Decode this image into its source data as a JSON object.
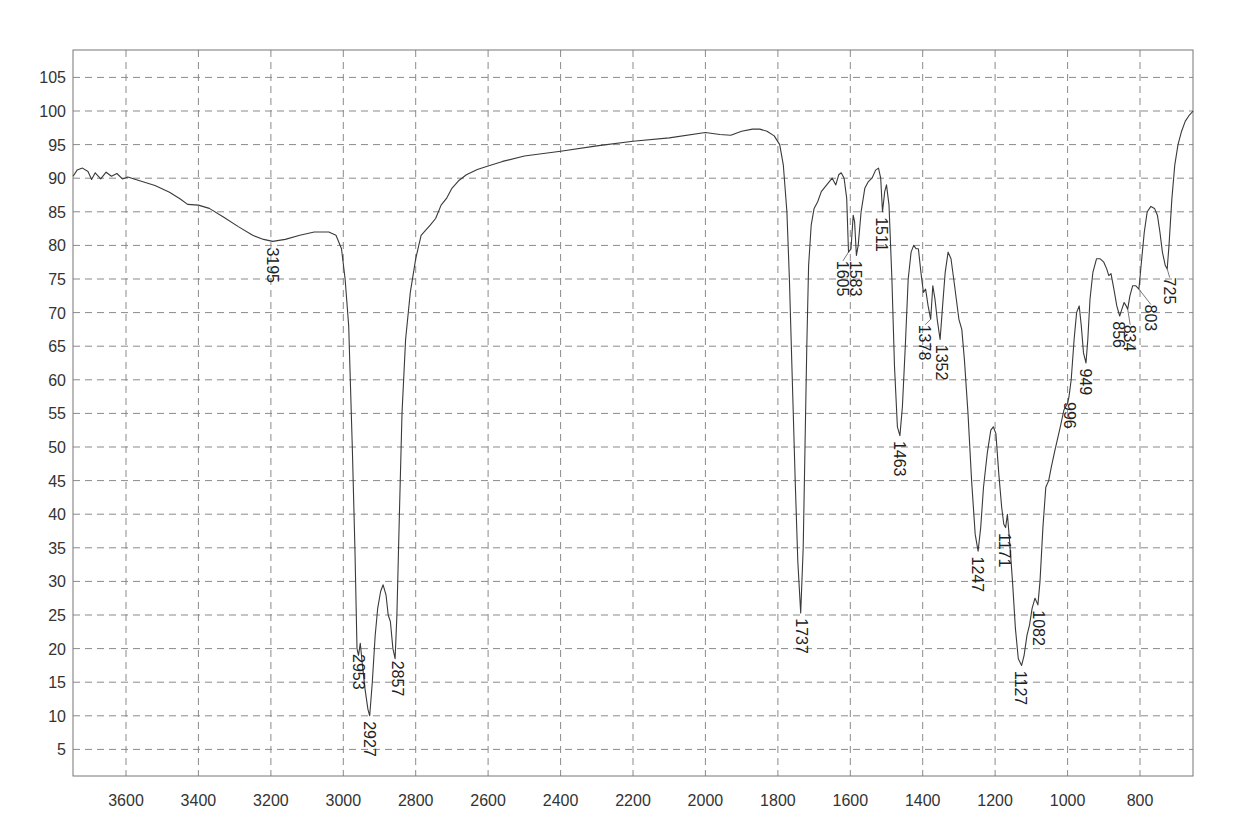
{
  "chart_data": {
    "type": "line",
    "title": "",
    "xlabel": "",
    "ylabel": "",
    "xlim": [
      3746,
      653
    ],
    "ylim": [
      1,
      109
    ],
    "x_reversed": true,
    "grid": true,
    "legend": null,
    "x_ticks": [
      3600,
      3400,
      3200,
      3000,
      2800,
      2600,
      2400,
      2200,
      2000,
      1800,
      1600,
      1400,
      1200,
      1000,
      800
    ],
    "y_ticks": [
      5,
      10,
      15,
      20,
      25,
      30,
      35,
      40,
      45,
      50,
      55,
      60,
      65,
      70,
      75,
      80,
      85,
      90,
      95,
      100,
      105
    ],
    "series": [
      {
        "name": "IR spectrum (%T)",
        "points": [
          [
            3746,
            90.3
          ],
          [
            3735,
            91.2
          ],
          [
            3720,
            91.5
          ],
          [
            3705,
            91.0
          ],
          [
            3695,
            89.8
          ],
          [
            3685,
            90.8
          ],
          [
            3670,
            89.9
          ],
          [
            3655,
            90.9
          ],
          [
            3640,
            90.3
          ],
          [
            3625,
            90.7
          ],
          [
            3610,
            89.9
          ],
          [
            3595,
            90.2
          ],
          [
            3560,
            89.6
          ],
          [
            3520,
            88.9
          ],
          [
            3480,
            87.9
          ],
          [
            3450,
            86.9
          ],
          [
            3430,
            86.1
          ],
          [
            3400,
            86.0
          ],
          [
            3370,
            85.5
          ],
          [
            3330,
            84.2
          ],
          [
            3290,
            82.8
          ],
          [
            3250,
            81.5
          ],
          [
            3220,
            80.9
          ],
          [
            3195,
            80.6
          ],
          [
            3160,
            80.9
          ],
          [
            3120,
            81.5
          ],
          [
            3080,
            82.0
          ],
          [
            3040,
            82.0
          ],
          [
            3020,
            81.5
          ],
          [
            3005,
            79.5
          ],
          [
            2995,
            75.0
          ],
          [
            2985,
            68.0
          ],
          [
            2975,
            50.0
          ],
          [
            2968,
            35.0
          ],
          [
            2962,
            20.0
          ],
          [
            2958,
            19.0
          ],
          [
            2953,
            20.8
          ],
          [
            2948,
            18.0
          ],
          [
            2940,
            14.0
          ],
          [
            2932,
            11.0
          ],
          [
            2927,
            10.0
          ],
          [
            2920,
            15.0
          ],
          [
            2912,
            22.0
          ],
          [
            2905,
            26.0
          ],
          [
            2897,
            28.5
          ],
          [
            2890,
            29.5
          ],
          [
            2882,
            28.0
          ],
          [
            2876,
            25.0
          ],
          [
            2870,
            24.0
          ],
          [
            2863,
            20.0
          ],
          [
            2857,
            18.5
          ],
          [
            2852,
            25.0
          ],
          [
            2845,
            40.0
          ],
          [
            2838,
            55.0
          ],
          [
            2828,
            66.0
          ],
          [
            2815,
            73.0
          ],
          [
            2800,
            78.0
          ],
          [
            2785,
            81.5
          ],
          [
            2760,
            83.0
          ],
          [
            2745,
            84.0
          ],
          [
            2730,
            86.0
          ],
          [
            2715,
            87.0
          ],
          [
            2700,
            88.5
          ],
          [
            2680,
            89.7
          ],
          [
            2660,
            90.5
          ],
          [
            2630,
            91.3
          ],
          [
            2600,
            91.8
          ],
          [
            2560,
            92.5
          ],
          [
            2500,
            93.3
          ],
          [
            2400,
            94.0
          ],
          [
            2300,
            94.8
          ],
          [
            2200,
            95.5
          ],
          [
            2100,
            96.0
          ],
          [
            2000,
            96.8
          ],
          [
            1960,
            96.5
          ],
          [
            1930,
            96.4
          ],
          [
            1900,
            97.0
          ],
          [
            1870,
            97.3
          ],
          [
            1850,
            97.3
          ],
          [
            1830,
            97.0
          ],
          [
            1810,
            96.3
          ],
          [
            1795,
            95.0
          ],
          [
            1785,
            92.0
          ],
          [
            1775,
            85.0
          ],
          [
            1768,
            75.0
          ],
          [
            1760,
            60.0
          ],
          [
            1752,
            45.0
          ],
          [
            1745,
            33.0
          ],
          [
            1737,
            25.3
          ],
          [
            1730,
            35.0
          ],
          [
            1725,
            50.0
          ],
          [
            1720,
            65.0
          ],
          [
            1715,
            77.0
          ],
          [
            1708,
            83.0
          ],
          [
            1700,
            85.5
          ],
          [
            1690,
            86.5
          ],
          [
            1680,
            88.0
          ],
          [
            1665,
            89.0
          ],
          [
            1650,
            90.0
          ],
          [
            1640,
            89.0
          ],
          [
            1632,
            90.5
          ],
          [
            1625,
            90.8
          ],
          [
            1617,
            90.0
          ],
          [
            1610,
            87.0
          ],
          [
            1605,
            79.0
          ],
          [
            1598,
            79.5
          ],
          [
            1592,
            84.5
          ],
          [
            1588,
            83.5
          ],
          [
            1583,
            78.5
          ],
          [
            1578,
            80.0
          ],
          [
            1570,
            85.0
          ],
          [
            1560,
            88.5
          ],
          [
            1550,
            89.5
          ],
          [
            1540,
            90.0
          ],
          [
            1530,
            91.2
          ],
          [
            1522,
            91.5
          ],
          [
            1516,
            90.0
          ],
          [
            1511,
            85.0
          ],
          [
            1505,
            88.0
          ],
          [
            1500,
            89.0
          ],
          [
            1493,
            86.0
          ],
          [
            1485,
            75.0
          ],
          [
            1478,
            62.0
          ],
          [
            1470,
            53.0
          ],
          [
            1463,
            51.7
          ],
          [
            1456,
            56.0
          ],
          [
            1448,
            65.0
          ],
          [
            1440,
            75.0
          ],
          [
            1432,
            79.0
          ],
          [
            1425,
            80.0
          ],
          [
            1418,
            79.5
          ],
          [
            1412,
            79.5
          ],
          [
            1405,
            76.0
          ],
          [
            1398,
            73.0
          ],
          [
            1392,
            73.5
          ],
          [
            1385,
            71.0
          ],
          [
            1378,
            69.0
          ],
          [
            1372,
            74.0
          ],
          [
            1366,
            72.0
          ],
          [
            1360,
            69.0
          ],
          [
            1352,
            66.0
          ],
          [
            1345,
            71.0
          ],
          [
            1338,
            76.0
          ],
          [
            1330,
            79.0
          ],
          [
            1322,
            78.0
          ],
          [
            1312,
            74.0
          ],
          [
            1300,
            69.0
          ],
          [
            1292,
            67.5
          ],
          [
            1285,
            63.0
          ],
          [
            1275,
            55.0
          ],
          [
            1265,
            45.0
          ],
          [
            1255,
            37.0
          ],
          [
            1247,
            34.5
          ],
          [
            1240,
            38.0
          ],
          [
            1232,
            44.0
          ],
          [
            1222,
            49.0
          ],
          [
            1212,
            52.5
          ],
          [
            1205,
            53.0
          ],
          [
            1198,
            52.0
          ],
          [
            1190,
            46.0
          ],
          [
            1182,
            41.0
          ],
          [
            1176,
            38.5
          ],
          [
            1171,
            38.0
          ],
          [
            1166,
            40.0
          ],
          [
            1160,
            36.0
          ],
          [
            1152,
            30.0
          ],
          [
            1144,
            23.0
          ],
          [
            1136,
            18.5
          ],
          [
            1127,
            17.5
          ],
          [
            1120,
            19.0
          ],
          [
            1112,
            22.0
          ],
          [
            1105,
            23.5
          ],
          [
            1098,
            26.0
          ],
          [
            1090,
            27.5
          ],
          [
            1082,
            26.5
          ],
          [
            1076,
            30.0
          ],
          [
            1068,
            38.0
          ],
          [
            1060,
            44.0
          ],
          [
            1052,
            45.0
          ],
          [
            1045,
            47.0
          ],
          [
            1035,
            49.5
          ],
          [
            1020,
            53.0
          ],
          [
            1010,
            55.5
          ],
          [
            1000,
            56.5
          ],
          [
            996,
            57.5
          ],
          [
            990,
            60.0
          ],
          [
            982,
            66.0
          ],
          [
            975,
            70.0
          ],
          [
            968,
            71.0
          ],
          [
            962,
            68.0
          ],
          [
            956,
            64.0
          ],
          [
            949,
            62.5
          ],
          [
            944,
            66.0
          ],
          [
            938,
            72.0
          ],
          [
            930,
            76.0
          ],
          [
            920,
            78.0
          ],
          [
            910,
            78.0
          ],
          [
            900,
            77.5
          ],
          [
            892,
            76.5
          ],
          [
            886,
            75.5
          ],
          [
            880,
            75.8
          ],
          [
            872,
            73.5
          ],
          [
            864,
            71.0
          ],
          [
            856,
            69.5
          ],
          [
            850,
            70.5
          ],
          [
            844,
            71.5
          ],
          [
            838,
            71.0
          ],
          [
            834,
            70.5
          ],
          [
            828,
            72.5
          ],
          [
            820,
            74.0
          ],
          [
            812,
            74.0
          ],
          [
            803,
            73.5
          ],
          [
            796,
            77.5
          ],
          [
            788,
            82.0
          ],
          [
            780,
            85.0
          ],
          [
            770,
            85.8
          ],
          [
            760,
            85.5
          ],
          [
            752,
            84.5
          ],
          [
            745,
            82.0
          ],
          [
            738,
            79.0
          ],
          [
            730,
            77.0
          ],
          [
            725,
            76.5
          ],
          [
            720,
            80.0
          ],
          [
            712,
            87.0
          ],
          [
            704,
            92.0
          ],
          [
            695,
            95.0
          ],
          [
            685,
            97.0
          ],
          [
            675,
            98.5
          ],
          [
            665,
            99.3
          ],
          [
            653,
            100.0
          ]
        ]
      }
    ],
    "annotations": [
      {
        "label": "3195",
        "x": 3195,
        "y": 80.6
      },
      {
        "label": "2953",
        "x": 2953,
        "y": 20.8
      },
      {
        "label": "2927",
        "x": 2927,
        "y": 10.0
      },
      {
        "label": "2857",
        "x": 2857,
        "y": 18.5
      },
      {
        "label": "1737",
        "x": 1737,
        "y": 25.3
      },
      {
        "label": "1605",
        "x": 1605,
        "y": 79.0
      },
      {
        "label": "1583",
        "x": 1583,
        "y": 78.5
      },
      {
        "label": "1511",
        "x": 1511,
        "y": 85.0
      },
      {
        "label": "1463",
        "x": 1463,
        "y": 51.7
      },
      {
        "label": "1378",
        "x": 1378,
        "y": 69.0
      },
      {
        "label": "1352",
        "x": 1352,
        "y": 66.0
      },
      {
        "label": "1247",
        "x": 1247,
        "y": 34.5
      },
      {
        "label": "1171",
        "x": 1171,
        "y": 38.0
      },
      {
        "label": "1127",
        "x": 1127,
        "y": 17.5
      },
      {
        "label": "1082",
        "x": 1082,
        "y": 26.5
      },
      {
        "label": "996",
        "x": 996,
        "y": 57.5
      },
      {
        "label": "949",
        "x": 949,
        "y": 62.5
      },
      {
        "label": "856",
        "x": 856,
        "y": 69.5
      },
      {
        "label": "834",
        "x": 834,
        "y": 70.5
      },
      {
        "label": "803",
        "x": 803,
        "y": 73.5
      },
      {
        "label": "725",
        "x": 725,
        "y": 76.5
      }
    ]
  },
  "labels_layout": [
    {
      "label": "3195",
      "lx": 3195,
      "ly": 80.0,
      "leader": null
    },
    {
      "label": "2953",
      "lx": 2958,
      "ly": 19.5,
      "leader": null
    },
    {
      "label": "2927",
      "lx": 2925,
      "ly": 9.5,
      "leader": null
    },
    {
      "label": "2857",
      "lx": 2848,
      "ly": 18.5,
      "leader": null
    },
    {
      "label": "1737",
      "lx": 1733,
      "ly": 24.8,
      "leader": null
    },
    {
      "label": "1605",
      "lx": 1620,
      "ly": 78.0,
      "leader": [
        1605,
        79.0
      ]
    },
    {
      "label": "1583",
      "lx": 1585,
      "ly": 78.0,
      "leader": null
    },
    {
      "label": "1511",
      "lx": 1513,
      "ly": 84.5,
      "leader": null
    },
    {
      "label": "1463",
      "lx": 1462,
      "ly": 51.2,
      "leader": null
    },
    {
      "label": "1378",
      "lx": 1393,
      "ly": 68.5,
      "leader": [
        1378,
        69.0
      ]
    },
    {
      "label": "1352",
      "lx": 1348,
      "ly": 65.5,
      "leader": null
    },
    {
      "label": "1247",
      "lx": 1248,
      "ly": 34.0,
      "leader": null
    },
    {
      "label": "1171",
      "lx": 1173,
      "ly": 37.5,
      "leader": null
    },
    {
      "label": "1127",
      "lx": 1130,
      "ly": 17.0,
      "leader": null
    },
    {
      "label": "1082",
      "lx": 1080,
      "ly": 26.0,
      "leader": null
    },
    {
      "label": "996",
      "lx": 993,
      "ly": 57.0,
      "leader": null
    },
    {
      "label": "949",
      "lx": 948,
      "ly": 62.0,
      "leader": null
    },
    {
      "label": "856",
      "lx": 857,
      "ly": 69.0,
      "leader": null
    },
    {
      "label": "834",
      "lx": 827,
      "ly": 68.5,
      "leader": [
        834,
        70.5
      ]
    },
    {
      "label": "803",
      "lx": 770,
      "ly": 71.5,
      "leader": [
        803,
        73.5
      ]
    },
    {
      "label": "725",
      "lx": 718,
      "ly": 75.5,
      "leader": [
        725,
        76.5
      ]
    }
  ],
  "plot_box": {
    "left": 73,
    "top": 50,
    "right": 1193,
    "bottom": 776
  },
  "mapping": {
    "x_ref_wn": 3600,
    "x_ref_px": 126,
    "px_per_wn": 0.36214,
    "y_ref_val": 100,
    "y_ref_px": 111,
    "px_per_unit": 6.72
  },
  "colors": {
    "curve": "#3a3a3a",
    "grid": "#8a8a8a",
    "frame": "#777777",
    "text": "#333333"
  }
}
